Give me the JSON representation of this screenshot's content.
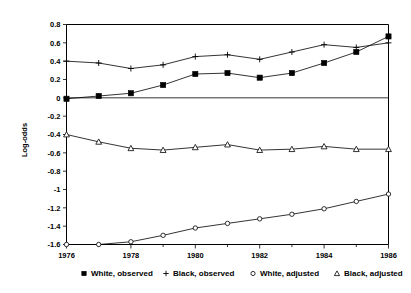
{
  "chart_data": {
    "type": "line",
    "title": "",
    "xlabel": "",
    "ylabel": "Log-odds",
    "xlim": [
      1976,
      1986
    ],
    "ylim": [
      -1.6,
      0.8
    ],
    "grid": false,
    "zero_reference_line": true,
    "legend_position": "bottom",
    "x": [
      1976,
      1977,
      1978,
      1979,
      1980,
      1981,
      1982,
      1983,
      1984,
      1985,
      1986
    ],
    "x_tick_labels": [
      "1976",
      "1978",
      "1980",
      "1982",
      "1984",
      "1986"
    ],
    "x_tick_values": [
      1976,
      1978,
      1980,
      1982,
      1984,
      1986
    ],
    "y_tick_labels": [
      "0.8",
      "0.6",
      "0.4",
      "0.2",
      "0",
      "-0.2",
      "-0.4",
      "-0.6",
      "-0.8",
      "-1",
      "-1.2",
      "-1.4",
      "-1.6"
    ],
    "y_tick_values": [
      0.8,
      0.6,
      0.4,
      0.2,
      0,
      -0.2,
      -0.4,
      -0.6,
      -0.8,
      -1,
      -1.2,
      -1.4,
      -1.6
    ],
    "series": [
      {
        "name": "White, observed",
        "marker": "filled-square",
        "values": [
          -0.01,
          0.02,
          0.05,
          0.14,
          0.26,
          0.27,
          0.22,
          0.27,
          0.38,
          0.5,
          0.67
        ]
      },
      {
        "name": "Black, observed",
        "marker": "plus",
        "values": [
          0.4,
          0.38,
          0.32,
          0.36,
          0.45,
          0.47,
          0.42,
          0.5,
          0.58,
          0.55,
          0.6
        ]
      },
      {
        "name": "White, adjusted",
        "marker": "open-circle",
        "values": [
          -1.6,
          -1.6,
          -1.57,
          -1.5,
          -1.42,
          -1.37,
          -1.32,
          -1.27,
          -1.21,
          -1.13,
          -1.05
        ]
      },
      {
        "name": "Black, adjusted",
        "marker": "open-triangle",
        "values": [
          -0.4,
          -0.48,
          -0.55,
          -0.57,
          -0.54,
          -0.51,
          -0.57,
          -0.56,
          -0.53,
          -0.56,
          -0.56
        ]
      }
    ]
  },
  "axis": {
    "y_title": "Log-odds"
  },
  "legend": {
    "items": [
      {
        "label": "White, observed",
        "marker": "filled-square"
      },
      {
        "label": "Black, observed",
        "marker": "plus"
      },
      {
        "label": "White, adjusted",
        "marker": "open-circle"
      },
      {
        "label": "Black, adjusted",
        "marker": "open-triangle"
      }
    ]
  }
}
